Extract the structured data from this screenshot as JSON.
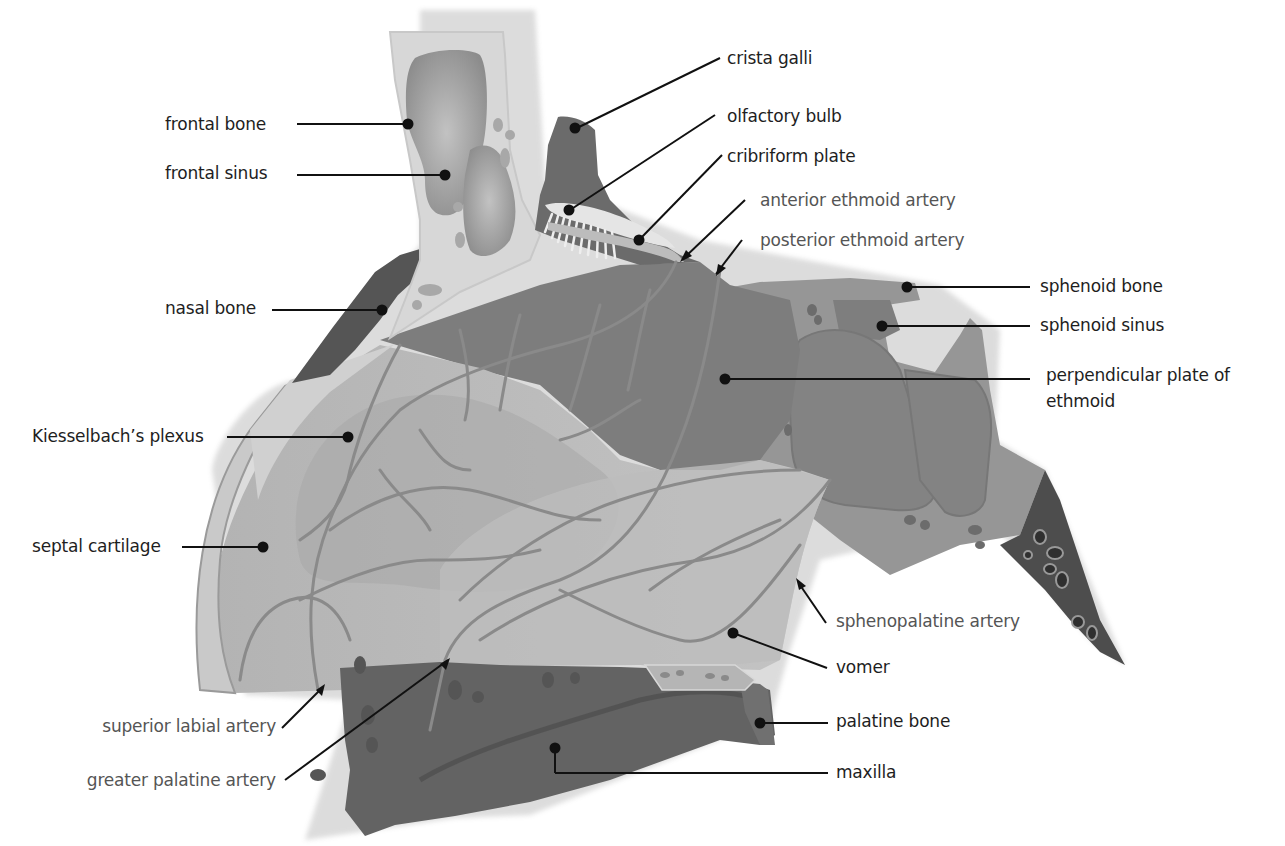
{
  "figure": {
    "colors": {
      "background": "#ffffff",
      "frontal_bone": "#d9d9d9",
      "sinus": "#9a9a9a",
      "dark_bone": "#5e5e5e",
      "ethmoid": "#7f7f7f",
      "septum_light": "#b8b8b8",
      "septum_mid": "#a6a6a6",
      "sphenoid": "#959595",
      "maxilla": "#626262",
      "vessel": "#8a8a8a",
      "leader_line": "#111111",
      "label_text": "#1e1e1e",
      "artery_label_text": "#555555"
    }
  },
  "labels": {
    "left": [
      {
        "id": "frontal_bone",
        "text": "frontal bone"
      },
      {
        "id": "frontal_sinus",
        "text": "frontal sinus"
      },
      {
        "id": "nasal_bone",
        "text": "nasal bone"
      },
      {
        "id": "kiesselbach",
        "text": "Kiesselbach’s plexus"
      },
      {
        "id": "septal_cartilage",
        "text": "septal cartilage"
      },
      {
        "id": "superior_labial_artery",
        "text": "superior labial artery"
      },
      {
        "id": "greater_palatine_artery",
        "text": "greater palatine artery"
      }
    ],
    "right": [
      {
        "id": "crista_galli",
        "text": "crista galli"
      },
      {
        "id": "olfactory_bulb",
        "text": "olfactory bulb"
      },
      {
        "id": "cribriform_plate",
        "text": "cribriform plate"
      },
      {
        "id": "anterior_ethmoid_artery",
        "text": "anterior ethmoid artery"
      },
      {
        "id": "posterior_ethmoid_artery",
        "text": "posterior ethmoid artery"
      },
      {
        "id": "sphenoid_bone",
        "text": "sphenoid bone"
      },
      {
        "id": "sphenoid_sinus",
        "text": "sphenoid sinus"
      },
      {
        "id": "perpendicular_plate",
        "text": "perpendicular plate of ethmoid"
      },
      {
        "id": "sphenopalatine_artery",
        "text": "sphenopalatine artery"
      },
      {
        "id": "vomer",
        "text": "vomer"
      },
      {
        "id": "palatine_bone",
        "text": "palatine bone"
      },
      {
        "id": "maxilla",
        "text": "maxilla"
      }
    ]
  }
}
